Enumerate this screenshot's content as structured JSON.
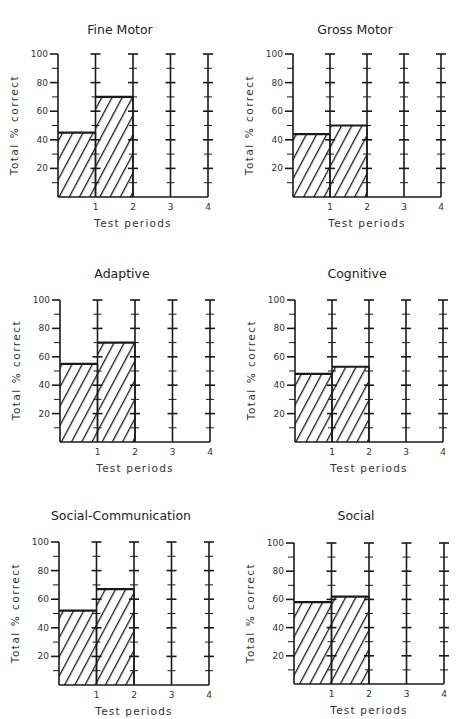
{
  "chart_data": [
    {
      "type": "bar",
      "title": "Fine Motor",
      "xlabel": "Test periods",
      "ylabel": "Total % correct",
      "categories": [
        "1",
        "2",
        "3",
        "4"
      ],
      "values": [
        45,
        70,
        null,
        null
      ],
      "ylim": [
        0,
        100
      ],
      "yticks": [
        20,
        40,
        60,
        80,
        100
      ],
      "grid": false,
      "pattern": "diagonal-hatch"
    },
    {
      "type": "bar",
      "title": "Gross Motor",
      "xlabel": "Test periods",
      "ylabel": "Total % correct",
      "categories": [
        "1",
        "2",
        "3",
        "4"
      ],
      "values": [
        44,
        50,
        null,
        null
      ],
      "ylim": [
        0,
        100
      ],
      "yticks": [
        20,
        40,
        60,
        80,
        100
      ],
      "grid": false,
      "pattern": "diagonal-hatch"
    },
    {
      "type": "bar",
      "title": "Adaptive",
      "xlabel": "Test periods",
      "ylabel": "Total % correct",
      "categories": [
        "1",
        "2",
        "3",
        "4"
      ],
      "values": [
        55,
        70,
        null,
        null
      ],
      "ylim": [
        0,
        100
      ],
      "yticks": [
        20,
        40,
        60,
        80,
        100
      ],
      "grid": false,
      "pattern": "diagonal-hatch"
    },
    {
      "type": "bar",
      "title": "Cognitive",
      "xlabel": "Test periods",
      "ylabel": "Total % correct",
      "categories": [
        "1",
        "2",
        "3",
        "4"
      ],
      "values": [
        48,
        53,
        null,
        null
      ],
      "ylim": [
        0,
        100
      ],
      "yticks": [
        20,
        40,
        60,
        80,
        100
      ],
      "grid": false,
      "pattern": "diagonal-hatch"
    },
    {
      "type": "bar",
      "title": "Social-Communication",
      "xlabel": "Test periods",
      "ylabel": "Total % correct",
      "categories": [
        "1",
        "2",
        "3",
        "4"
      ],
      "values": [
        52,
        67,
        null,
        null
      ],
      "ylim": [
        0,
        100
      ],
      "yticks": [
        20,
        40,
        60,
        80,
        100
      ],
      "grid": false,
      "pattern": "diagonal-hatch"
    },
    {
      "type": "bar",
      "title": "Social",
      "xlabel": "Test periods",
      "ylabel": "Total % correct",
      "categories": [
        "1",
        "2",
        "3",
        "4"
      ],
      "values": [
        58,
        62,
        null,
        null
      ],
      "ylim": [
        0,
        100
      ],
      "yticks": [
        20,
        40,
        60,
        80,
        100
      ],
      "grid": false,
      "pattern": "diagonal-hatch"
    }
  ],
  "layout": {
    "panels": [
      {
        "x": 0,
        "y": 0,
        "titleY": 22,
        "axisLeft": 58,
        "axisTop": 54,
        "axisBottom": 197,
        "step": 37.5
      },
      {
        "x": 0,
        "y": 0,
        "titleY": 22,
        "axisLeft": 293,
        "axisTop": 54,
        "axisBottom": 197,
        "step": 37
      },
      {
        "x": 0,
        "y": 0,
        "titleY": 266,
        "axisLeft": 60,
        "axisTop": 300,
        "axisBottom": 442,
        "step": 37.5
      },
      {
        "x": 0,
        "y": 0,
        "titleY": 266,
        "axisLeft": 295,
        "axisTop": 300,
        "axisBottom": 442,
        "step": 37
      },
      {
        "x": 0,
        "y": 0,
        "titleY": 508,
        "axisLeft": 59,
        "axisTop": 542,
        "axisBottom": 685,
        "step": 37.5
      },
      {
        "x": 0,
        "y": 0,
        "titleY": 508,
        "axisLeft": 294,
        "axisTop": 543,
        "axisBottom": 684,
        "step": 37.5
      }
    ],
    "ink": "#1a1a1a"
  }
}
